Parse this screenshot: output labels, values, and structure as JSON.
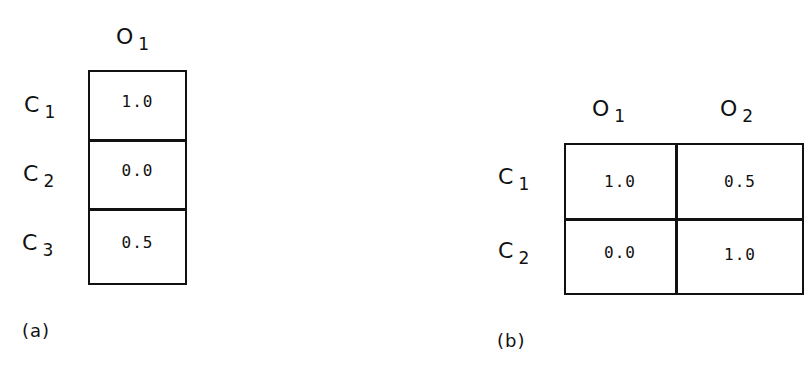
{
  "panel_a": {
    "caption": "(a)",
    "columns": [
      {
        "letter": "O",
        "sub": "1"
      }
    ],
    "rows": [
      {
        "letter": "C",
        "sub": "1"
      },
      {
        "letter": "C",
        "sub": "2"
      },
      {
        "letter": "C",
        "sub": "3"
      }
    ],
    "values": [
      [
        "1.0"
      ],
      [
        "0.0"
      ],
      [
        "0.5"
      ]
    ]
  },
  "panel_b": {
    "caption": "(b)",
    "columns": [
      {
        "letter": "O",
        "sub": "1"
      },
      {
        "letter": "O",
        "sub": "2"
      }
    ],
    "rows": [
      {
        "letter": "C",
        "sub": "1"
      },
      {
        "letter": "C",
        "sub": "2"
      }
    ],
    "values": [
      [
        "1.0",
        "0.5"
      ],
      [
        "0.0",
        "1.0"
      ]
    ]
  }
}
